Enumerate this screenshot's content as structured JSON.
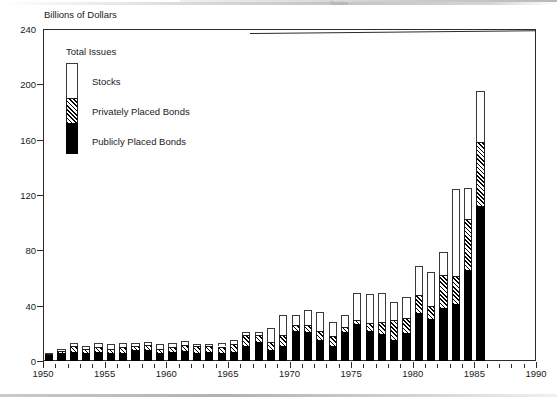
{
  "scan": {
    "header_ghost": "Totals"
  },
  "chart_data": {
    "type": "bar",
    "subtype": "stacked-vertical",
    "title": "",
    "axis_note": "Billions of Dollars",
    "xlabel": "",
    "ylabel": "Billions of Dollars",
    "ylim": [
      0,
      240
    ],
    "yticks": [
      0,
      40,
      80,
      120,
      160,
      200,
      240
    ],
    "xlim": [
      1950,
      1990
    ],
    "xticks": [
      1950,
      1955,
      1960,
      1965,
      1970,
      1975,
      1980,
      1985,
      1990
    ],
    "x_tick_step_minor": 1,
    "grid": false,
    "legend_position": "inside-top-left",
    "legend_title": "Total Issues",
    "series": [
      {
        "name": "Publicly Placed Bonds",
        "fill": "solid-black",
        "color": "#000000",
        "values": [
          4.0,
          5.5,
          6.5,
          6.0,
          6.5,
          5.5,
          6.0,
          8.0,
          8.0,
          6.0,
          6.5,
          7.5,
          6.0,
          6.5,
          5.5,
          6.5,
          10.5,
          13.5,
          8.0,
          11.0,
          21.5,
          21.0,
          15.0,
          11.0,
          21.0,
          27.0,
          21.5,
          19.5,
          15.0,
          20.0,
          34.5,
          30.5,
          38.0,
          41.0,
          66.0,
          112.0
        ]
      },
      {
        "name": "Privately Placed Bonds",
        "fill": "diagonal-hatch",
        "color": "#ffffff",
        "values": [
          1.0,
          1.5,
          4.0,
          2.5,
          3.5,
          3.5,
          4.0,
          3.0,
          3.5,
          2.5,
          3.5,
          4.0,
          4.5,
          4.0,
          5.0,
          5.5,
          8.0,
          5.5,
          6.0,
          8.0,
          4.5,
          5.0,
          6.5,
          7.0,
          3.5,
          3.0,
          6.0,
          9.0,
          15.0,
          11.0,
          13.5,
          9.0,
          24.0,
          20.5,
          37.0,
          46.0
        ]
      },
      {
        "name": "Stocks",
        "fill": "white",
        "color": "#ffffff",
        "values": [
          1.0,
          2.0,
          2.5,
          2.5,
          3.0,
          3.5,
          3.0,
          2.0,
          2.0,
          3.5,
          3.0,
          3.0,
          2.0,
          2.0,
          2.5,
          3.5,
          2.5,
          2.0,
          10.0,
          14.0,
          7.5,
          11.0,
          14.0,
          10.0,
          9.0,
          19.0,
          21.0,
          20.5,
          12.5,
          15.5,
          20.5,
          25.0,
          17.0,
          63.0,
          22.0,
          37.0
        ]
      }
    ],
    "categories": [
      1950,
      1951,
      1952,
      1953,
      1954,
      1955,
      1956,
      1957,
      1958,
      1959,
      1960,
      1961,
      1962,
      1963,
      1964,
      1965,
      1966,
      1967,
      1968,
      1969,
      1970,
      1971,
      1972,
      1973,
      1974,
      1975,
      1976,
      1977,
      1978,
      1979,
      1980,
      1981,
      1982,
      1983,
      1984,
      1985
    ],
    "totals": [
      6.0,
      9.0,
      13.0,
      11.0,
      13.0,
      12.5,
      13.0,
      13.0,
      13.5,
      12.0,
      13.0,
      14.5,
      12.5,
      12.5,
      13.0,
      15.5,
      21.0,
      21.0,
      24.0,
      33.0,
      33.5,
      37.0,
      35.5,
      28.0,
      33.5,
      49.0,
      48.5,
      49.0,
      42.5,
      46.5,
      68.5,
      64.5,
      79.0,
      124.5,
      125.0,
      195.0
    ]
  },
  "legend": {
    "title": "Total Issues",
    "items": [
      {
        "label": "Stocks"
      },
      {
        "label": "Privately Placed Bonds"
      },
      {
        "label": "Publicly Placed Bonds"
      }
    ]
  }
}
